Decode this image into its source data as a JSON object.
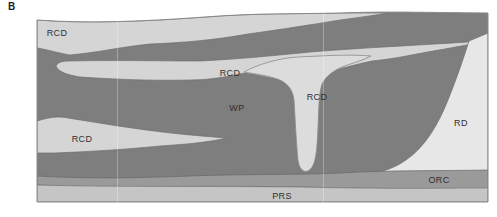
{
  "figure": {
    "panel_label": "B",
    "type": "schematic-cross-section",
    "labels": [
      {
        "id": "rcd-top-band",
        "text": "RCD"
      },
      {
        "id": "rcd-middle-band",
        "text": "RCD"
      },
      {
        "id": "rcd-funnel",
        "text": "RCD"
      },
      {
        "id": "rcd-lower-tongue",
        "text": "RCD"
      },
      {
        "id": "wp-host",
        "text": "WP"
      },
      {
        "id": "rd-region",
        "text": "RD"
      },
      {
        "id": "orc-band",
        "text": "ORC"
      },
      {
        "id": "prs-band",
        "text": "PRS"
      }
    ],
    "colors": {
      "background": "#ffffff",
      "wp": "#7e7e7e",
      "rcd_band": "#d5d5d5",
      "rcd_funnel": "#dcdcdc",
      "rd": "#e7e7e7",
      "orc": "#9a9a9a",
      "prs": "#c5c5c5",
      "outline": "#6f6f6f",
      "funnel_outline": "#8a8a8a",
      "border": "#8a8a8a",
      "label_text": "#2f2f2f"
    }
  }
}
